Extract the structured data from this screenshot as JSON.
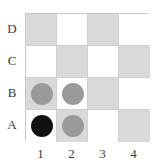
{
  "figure": {
    "name": "checkerboard-grid",
    "rows": 4,
    "columns": 4,
    "row_labels": [
      "D",
      "C",
      "B",
      "A"
    ],
    "column_labels": [
      "1",
      "2",
      "3",
      "4"
    ],
    "colors": {
      "light_square": "#ffffff",
      "dark_square": "#d9d9d9",
      "grid_line": "#c8c8c8",
      "gray_piece": "#9a9a9a",
      "black_piece": "#101010",
      "label_text": "#3b3b3b",
      "background": "#ffffff"
    },
    "squares": [
      {
        "row": "D",
        "column": "1",
        "shade": "dark",
        "piece": ""
      },
      {
        "row": "D",
        "column": "2",
        "shade": "light",
        "piece": ""
      },
      {
        "row": "D",
        "column": "3",
        "shade": "dark",
        "piece": ""
      },
      {
        "row": "D",
        "column": "4",
        "shade": "light",
        "piece": ""
      },
      {
        "row": "C",
        "column": "1",
        "shade": "light",
        "piece": ""
      },
      {
        "row": "C",
        "column": "2",
        "shade": "dark",
        "piece": ""
      },
      {
        "row": "C",
        "column": "3",
        "shade": "light",
        "piece": ""
      },
      {
        "row": "C",
        "column": "4",
        "shade": "dark",
        "piece": ""
      },
      {
        "row": "B",
        "column": "1",
        "shade": "dark",
        "piece": "gray"
      },
      {
        "row": "B",
        "column": "2",
        "shade": "light",
        "piece": "gray"
      },
      {
        "row": "B",
        "column": "3",
        "shade": "dark",
        "piece": ""
      },
      {
        "row": "B",
        "column": "4",
        "shade": "light",
        "piece": ""
      },
      {
        "row": "A",
        "column": "1",
        "shade": "light",
        "piece": "black"
      },
      {
        "row": "A",
        "column": "2",
        "shade": "dark",
        "piece": "gray"
      },
      {
        "row": "A",
        "column": "3",
        "shade": "light",
        "piece": ""
      },
      {
        "row": "A",
        "column": "4",
        "shade": "dark",
        "piece": ""
      }
    ]
  }
}
